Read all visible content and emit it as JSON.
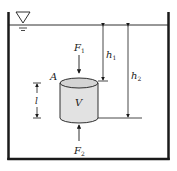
{
  "diagram": {
    "type": "hydrostatic-buoyancy",
    "colors": {
      "stroke": "#1a1a1a",
      "cylinder_fill": "#e2e2e2",
      "cylinder_top": "#d4d4d4",
      "background": "#ffffff"
    },
    "labels": {
      "force_top": "F",
      "force_top_sub": "1",
      "force_bottom": "F",
      "force_bottom_sub": "2",
      "area": "A",
      "volume": "V",
      "length": "l",
      "depth_top": "h",
      "depth_top_sub": "1",
      "depth_bottom": "h",
      "depth_bottom_sub": "2"
    },
    "icons": {
      "free_surface_marker": "inverted-triangle-icon"
    }
  }
}
